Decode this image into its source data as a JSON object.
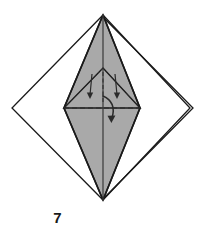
{
  "figure": {
    "kind": "origami-fold-diagram",
    "step_number": "7",
    "caption": "7",
    "background_color": "#ffffff",
    "colors": {
      "paper_front": "#ffffff",
      "paper_shaded": "#a9a9a9",
      "outline": "#1a1a1a",
      "crease_valley": "#2b2b2b",
      "arrow": "#2b2b2b",
      "label_text": "#1a1a1a"
    },
    "line_styles": {
      "edge": "solid",
      "crease": "dashed",
      "hidden_edge": "dash-dot"
    },
    "geometry": {
      "outer_diamond": {
        "top": [
          103,
          15
        ],
        "right": [
          190,
          108
        ],
        "bottom": [
          103,
          200
        ],
        "left": [
          12,
          108
        ],
        "note": "square rotated 45 degrees, double line on right edge"
      },
      "shaded_kite": {
        "top": [
          103,
          15
        ],
        "right": [
          140,
          108
        ],
        "bottom": [
          103,
          200
        ],
        "left": [
          64,
          108
        ]
      },
      "inner_triangle": {
        "apex": [
          103,
          68
        ],
        "left": [
          64,
          108
        ],
        "right": [
          140,
          108
        ]
      },
      "center_vertical_crease": {
        "from": [
          103,
          15
        ],
        "to": [
          103,
          200
        ]
      },
      "horizontal_crease": {
        "from": [
          64,
          108
        ],
        "to": [
          140,
          108
        ]
      }
    },
    "arrows": [
      {
        "name": "left-petal-fold-arrow",
        "type": "straight-down",
        "from": [
          92,
          74
        ],
        "to": [
          90,
          97
        ]
      },
      {
        "name": "right-petal-fold-arrow",
        "type": "straight-down",
        "from": [
          115,
          74
        ],
        "to": [
          117,
          97
        ]
      },
      {
        "name": "center-fold-down-arrow",
        "type": "curved-down",
        "from": [
          104,
          96
        ],
        "to": [
          111,
          122
        ]
      }
    ],
    "labels": {
      "step": "7"
    }
  }
}
